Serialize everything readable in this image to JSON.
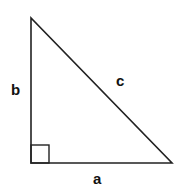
{
  "diagram": {
    "stroke_color": "#222222",
    "labels": {
      "a": "a",
      "b": "b",
      "c": "c"
    },
    "vertices": {
      "top": [
        31,
        18
      ],
      "right_angle": [
        31,
        163
      ],
      "right": [
        172,
        163
      ]
    },
    "right_angle_marker_size": 18
  }
}
